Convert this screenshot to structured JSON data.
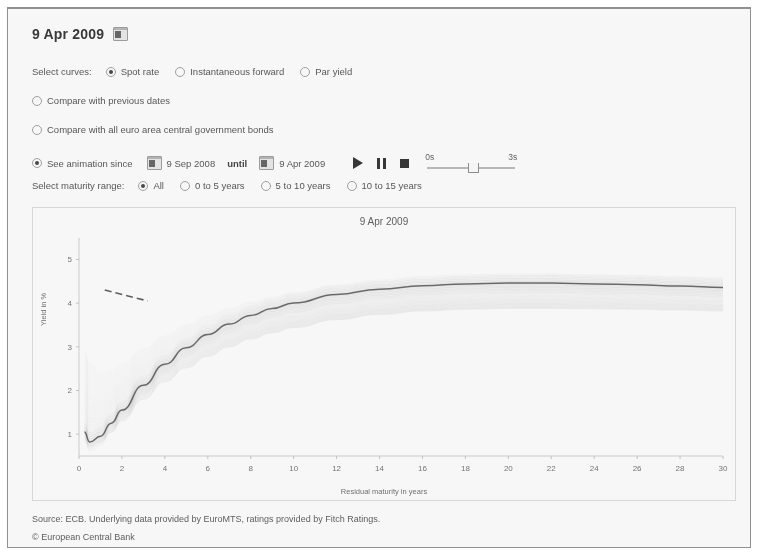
{
  "header": {
    "date": "9 Apr 2009",
    "calendar_icon": "calendar-icon"
  },
  "controls": {
    "select_curves_label": "Select curves:",
    "curve_options": [
      {
        "label": "Spot rate",
        "selected": true
      },
      {
        "label": "Instantaneous forward",
        "selected": false
      },
      {
        "label": "Par yield",
        "selected": false
      }
    ],
    "compare_previous": {
      "label": "Compare with previous dates",
      "selected": false
    },
    "compare_euro": {
      "label": "Compare with all euro area central government bonds",
      "selected": false
    },
    "animation": {
      "label": "See animation since",
      "start_date": "9 Sep 2008",
      "until_label": "until",
      "end_date": "9 Apr 2009",
      "play_icon": "play-icon",
      "pause_icon": "pause-icon",
      "stop_icon": "stop-icon",
      "slider_min": "0s",
      "slider_max": "3s",
      "slider_value_pct": 46
    },
    "maturity": {
      "label": "Select maturity range:",
      "options": [
        {
          "label": "All",
          "selected": true
        },
        {
          "label": "0 to 5 years",
          "selected": false
        },
        {
          "label": "5 to 10 years",
          "selected": false
        },
        {
          "label": "10 to 15 years",
          "selected": false
        }
      ]
    }
  },
  "footer": {
    "source": "Source: ECB. Underlying data provided by EuroMTS, ratings provided by Fitch Ratings.",
    "copyright": "© European Central Bank"
  },
  "chart_data": {
    "type": "line",
    "title": "9 Apr 2009",
    "xlabel": "Residual maturity in years",
    "ylabel": "Yield in %",
    "xlim": [
      0,
      30
    ],
    "ylim": [
      0.5,
      5.4
    ],
    "xticks": [
      0,
      2,
      4,
      6,
      8,
      10,
      12,
      14,
      16,
      18,
      20,
      22,
      24,
      26,
      28,
      30
    ],
    "yticks": [
      1,
      2,
      3,
      4,
      5
    ],
    "grid": false,
    "legend": null,
    "x": [
      0.25,
      0.5,
      1,
      1.5,
      2,
      3,
      4,
      5,
      6,
      7,
      8,
      9,
      10,
      12,
      14,
      16,
      18,
      20,
      22,
      24,
      26,
      28,
      30
    ],
    "series": [
      {
        "name": "9 Apr 2009 (current spot rate curve)",
        "emphasis": "highlighted",
        "values": [
          1.05,
          0.82,
          0.95,
          1.25,
          1.55,
          2.12,
          2.6,
          2.98,
          3.28,
          3.52,
          3.72,
          3.88,
          4.0,
          4.2,
          4.32,
          4.4,
          4.44,
          4.46,
          4.46,
          4.44,
          4.42,
          4.39,
          4.36
        ]
      },
      {
        "name": "animation trail upper envelope",
        "emphasis": "faded",
        "values": [
          2.9,
          2.6,
          2.4,
          2.45,
          2.6,
          2.95,
          3.25,
          3.5,
          3.7,
          3.88,
          4.02,
          4.14,
          4.24,
          4.4,
          4.5,
          4.57,
          4.62,
          4.64,
          4.65,
          4.64,
          4.62,
          4.6,
          4.57
        ]
      },
      {
        "name": "animation trail lower envelope",
        "emphasis": "faded",
        "values": [
          0.9,
          0.72,
          0.82,
          1.05,
          1.3,
          1.8,
          2.2,
          2.52,
          2.78,
          3.0,
          3.18,
          3.32,
          3.44,
          3.62,
          3.74,
          3.82,
          3.86,
          3.88,
          3.88,
          3.87,
          3.86,
          3.84,
          3.82
        ]
      }
    ],
    "annotation": {
      "name": "dashed-segment",
      "x_range": [
        1.2,
        3.2
      ],
      "y_range": [
        4.3,
        4.05
      ]
    }
  }
}
